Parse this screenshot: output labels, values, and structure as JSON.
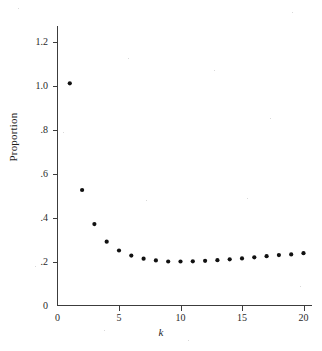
{
  "chart_data": {
    "type": "scatter",
    "title": "",
    "xlabel": "k",
    "ylabel": "Proportion",
    "x": [
      1,
      2,
      3,
      4,
      5,
      6,
      7,
      8,
      9,
      10,
      11,
      12,
      13,
      14,
      15,
      16,
      17,
      18,
      19,
      20
    ],
    "values": [
      1.01,
      0.525,
      0.37,
      0.29,
      0.25,
      0.227,
      0.213,
      0.205,
      0.2,
      0.2,
      0.201,
      0.203,
      0.206,
      0.21,
      0.214,
      0.219,
      0.224,
      0.229,
      0.232,
      0.238
    ],
    "series": [
      {
        "name": "Proportion",
        "values": [
          1.01,
          0.525,
          0.37,
          0.29,
          0.25,
          0.227,
          0.213,
          0.205,
          0.2,
          0.2,
          0.201,
          0.203,
          0.206,
          0.21,
          0.214,
          0.219,
          0.224,
          0.229,
          0.232,
          0.238
        ]
      }
    ],
    "xlim": [
      0,
      21.5
    ],
    "ylim": [
      0,
      1.28
    ],
    "xticks": [
      0,
      5,
      10,
      15,
      20
    ],
    "xtick_labels": [
      "0",
      "5",
      "10",
      "15",
      "20"
    ],
    "yticks": [
      0,
      0.2,
      0.4,
      0.6,
      0.8,
      1.0,
      1.2
    ],
    "ytick_labels": [
      "0",
      ".2",
      ".4",
      ".6",
      ".8",
      "1.0",
      "1.2"
    ],
    "grid": false,
    "legend": false,
    "marker": "filled-circle",
    "marker_color": "#111111",
    "axis_color": "#3c3c3c",
    "background_color": "#ffffff"
  }
}
